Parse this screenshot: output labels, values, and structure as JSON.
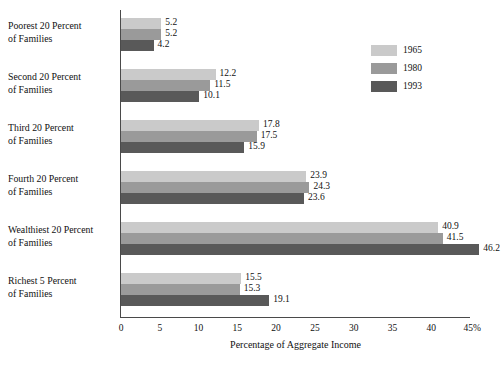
{
  "chart_data": {
    "type": "bar",
    "orientation": "horizontal",
    "title": "",
    "xlabel": "Percentage of Aggregate Income",
    "ylabel": "",
    "xlim": [
      0,
      45
    ],
    "xticks": [
      "0",
      "5",
      "10",
      "15",
      "20",
      "25",
      "30",
      "35",
      "40",
      "45%"
    ],
    "xtick_values": [
      0,
      5,
      10,
      15,
      20,
      25,
      30,
      35,
      40,
      45
    ],
    "grid": false,
    "legend_position": "upper right",
    "categories": [
      "Poorest 20 Percent of Families",
      "Second 20 Percent of Families",
      "Third 20 Percent of Families",
      "Fourth 20 Percent of Families",
      "Wealthiest 20 Percent of Families",
      "Richest 5 Percent of Families"
    ],
    "category_lines": [
      [
        "Poorest 20 Percent",
        "of Families"
      ],
      [
        "Second 20 Percent",
        "of Families"
      ],
      [
        "Third 20 Percent",
        "of Families"
      ],
      [
        "Fourth 20 Percent",
        "of Families"
      ],
      [
        "Wealthiest 20 Percent",
        "of Families"
      ],
      [
        "Richest 5 Percent",
        "of Families"
      ]
    ],
    "series": [
      {
        "name": "1965",
        "color": "#cacaca",
        "values": [
          5.2,
          12.2,
          17.8,
          23.9,
          40.9,
          15.5
        ],
        "labels": [
          "5.2",
          "12.2",
          "17.8",
          "23.9",
          "40.9",
          "15.5"
        ]
      },
      {
        "name": "1980",
        "color": "#9a9a9a",
        "values": [
          5.2,
          11.5,
          17.5,
          24.3,
          41.5,
          15.3
        ],
        "labels": [
          "5.2",
          "11.5",
          "17.5",
          "24.3",
          "41.5",
          "15.3"
        ]
      },
      {
        "name": "1993",
        "color": "#595959",
        "values": [
          4.2,
          10.1,
          15.9,
          23.6,
          46.2,
          19.1
        ],
        "labels": [
          "4.2",
          "10.1",
          "15.9",
          "23.6",
          "46.2",
          "19.1"
        ]
      }
    ]
  },
  "legend": {
    "entries": [
      {
        "label": "1965",
        "color": "#cacaca"
      },
      {
        "label": "1980",
        "color": "#9a9a9a"
      },
      {
        "label": "1993",
        "color": "#595959"
      }
    ]
  }
}
